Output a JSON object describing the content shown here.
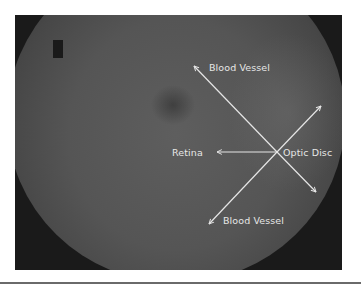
{
  "figure": {
    "colors": {
      "frame": "#1a1a1a",
      "fundus": "#555555",
      "annotation": "#e6e6e6",
      "page": "#ffffff"
    },
    "labels": {
      "blood_vessel_top": "Blood Vessel",
      "retina": "Retina",
      "optic_disc": "Optic Disc",
      "blood_vessel_bottom": "Blood Vessel"
    },
    "arrows": [
      {
        "name": "arrow-upper-left",
        "from": [
          277,
          152
        ],
        "to": [
          193,
          65
        ]
      },
      {
        "name": "arrow-lower-right",
        "from": [
          277,
          152
        ],
        "to": [
          317,
          193
        ]
      },
      {
        "name": "arrow-upper-right",
        "from": [
          277,
          152
        ],
        "to": [
          322,
          105
        ]
      },
      {
        "name": "arrow-lower-left",
        "from": [
          277,
          152
        ],
        "to": [
          208,
          225
        ]
      },
      {
        "name": "arrow-left",
        "from": [
          277,
          152
        ],
        "to": [
          216,
          152
        ]
      }
    ]
  }
}
